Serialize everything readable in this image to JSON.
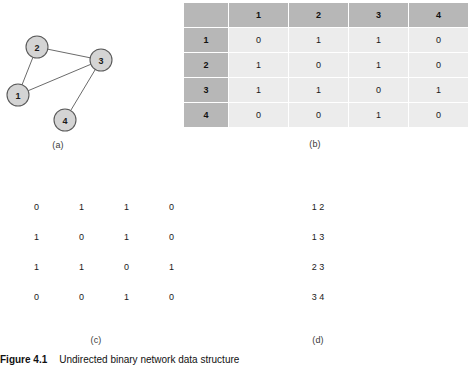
{
  "figure": {
    "caption_number": "Figure 4.1",
    "caption_text": "Undirected binary network data structure"
  },
  "subcaptions": {
    "a": "(a)",
    "b": "(b)",
    "c": "(c)",
    "d": "(d)"
  },
  "graph": {
    "nodes": [
      {
        "id": "1",
        "label": "1",
        "cx": 18,
        "cy": 95
      },
      {
        "id": "2",
        "label": "2",
        "cx": 37,
        "cy": 47
      },
      {
        "id": "3",
        "label": "3",
        "cx": 101,
        "cy": 60
      },
      {
        "id": "4",
        "label": "4",
        "cx": 65,
        "cy": 120
      }
    ],
    "edges": [
      {
        "from": "1",
        "to": "2"
      },
      {
        "from": "1",
        "to": "3"
      },
      {
        "from": "2",
        "to": "3"
      },
      {
        "from": "3",
        "to": "4"
      }
    ],
    "node_radius": 11,
    "node_fill": "#d4d4d4",
    "node_stroke": "#5a5a5a",
    "edge_stroke": "#6b6b6b"
  },
  "adjacency_table": {
    "corner": "",
    "columns": [
      "1",
      "2",
      "3",
      "4"
    ],
    "rows": [
      {
        "header": "1",
        "values": [
          "0",
          "1",
          "1",
          "0"
        ]
      },
      {
        "header": "2",
        "values": [
          "1",
          "0",
          "1",
          "0"
        ]
      },
      {
        "header": "3",
        "values": [
          "1",
          "1",
          "0",
          "1"
        ]
      },
      {
        "header": "4",
        "values": [
          "0",
          "0",
          "1",
          "0"
        ]
      }
    ],
    "header_bg": "#b7b7b7",
    "cell_bg": "#ececec"
  },
  "plain_matrix": {
    "rows": [
      [
        "0",
        "1",
        "1",
        "0"
      ],
      [
        "1",
        "0",
        "1",
        "0"
      ],
      [
        "1",
        "1",
        "0",
        "1"
      ],
      [
        "0",
        "0",
        "1",
        "0"
      ]
    ]
  },
  "edge_list": {
    "entries": [
      "1 2",
      "1 3",
      "2 3",
      "3 4"
    ]
  }
}
